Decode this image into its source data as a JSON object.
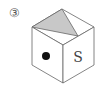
{
  "label": "③",
  "cube": {
    "front_face_symbol": "dot",
    "right_face_text": "S",
    "top_face_shading": "gray triangle",
    "shade_color": "#c8c8c8",
    "line_color": "#555555"
  }
}
